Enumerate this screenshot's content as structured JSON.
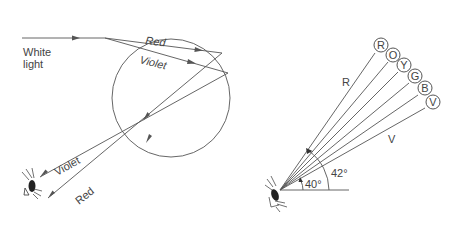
{
  "left_panel": {
    "labels": {
      "white_light_line1": "White",
      "white_light_line2": "light",
      "red_inside": "Red",
      "violet_inside": "Violet",
      "violet_out": "Violet",
      "red_out": "Red"
    }
  },
  "right_panel": {
    "color_circles": [
      "R",
      "O",
      "Y",
      "G",
      "B",
      "V"
    ],
    "labels": {
      "r_ray": "R",
      "v_ray": "V",
      "angle_inner": "40°",
      "angle_outer": "42°"
    }
  },
  "colors": {
    "line": "#555555",
    "text": "#444444",
    "background": "#ffffff"
  }
}
